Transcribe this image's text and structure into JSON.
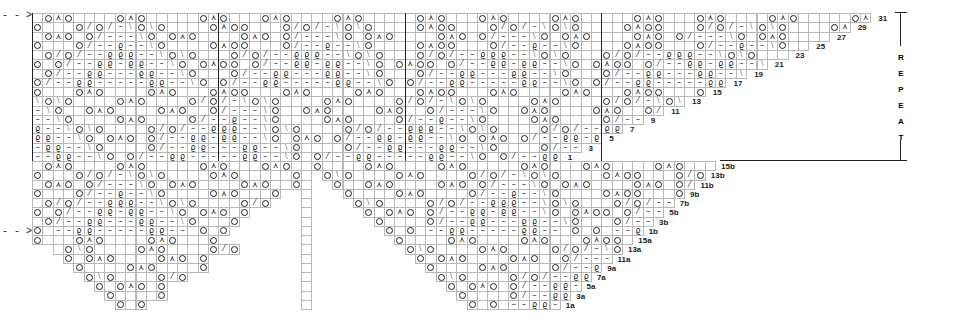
{
  "grid": {
    "origin_x": 32,
    "origin_y": 13,
    "cell_w": 10.35,
    "cell_h": 9.25,
    "line_color": "#b8b8b8",
    "ink_color": "#222222"
  },
  "legend_symbols": {
    "o": "yarn-over",
    "^": "double-decrease",
    "/": "k2tog",
    "\\": "ssk",
    "-": "purl",
    "8": "twisted-stitch",
    " ": "knit",
    ".": "no-stitch"
  },
  "upper_section": {
    "label": "repeat section",
    "rows": [
      {
        "row": 31,
        "cells": " o^o    o^o     o^o   o^o    o^o     o^o   o^o    o^o     o^o   o^o    o^o     o^o   o^o    o^o     o^o      o"
      },
      {
        "row": 30,
        "cells": "o   o/o/-\\o\\o    o^oo   o/o/-\\o\\o    o^oo   o/o/-\\o\\o    o^oo   o/o/-\\o\\o    o^oo   o/o/-\\o\\o   o^o  o/o"
      },
      {
        "row": 29,
        "cells": " o^o o/---\\o o^o    o^o o/---\\o o^o    o^o o/---\\o o^o    o^o o/---\\o o^o    o^o o/---\\o o^o  o^o o"
      },
      {
        "row": 28,
        "cells": "o   o/--8--\\o    o^oo   o/--8--\\o    o^oo   o/--8--\\o    o^oo   o/--8--\\o    o^oo   o/--8--\\o   o^o o"
      },
      {
        "row": 27,
        "cells": " o/o/--888--\\o\\o   o/o/--888--\\o\\o   o/o/--888--\\o\\o   o/o/--888--\\o\\o   o/o/--888--\\o\\o  o/o"
      },
      {
        "row": 26,
        "cells": "o o/--88-88--\\o o^oo o/--88-88--\\o o^oo o/--88-88--\\o o^oo o/--88-88--\\o o^oo o/--88-88--\\o o^o o"
      },
      {
        "row": 25,
        "cells": " o/--88---88--\\o   o/--88---88--\\o   o/--88---88--\\o   o/--88---88--\\o   o/--88---88--\\o   o"
      },
      {
        "row": 24,
        "cells": "o/--88-----88--\\o o/--88-----88--\\o o/--88-----88--\\o o/--88-----88--\\o o/--88-----88--  o o"
      },
      {
        "row": 23,
        "cells": "o   o^o    o^o   o^oo   o^o    o^o   o^oo   o^o    o^o   o^oo   o^o    o^o   o^oo   o^o    o^o   o o"
      },
      {
        "row": 22,
        "cells": "\\o\\o    o^o    o/o/-\\o\\o    o^o    o/o/-\\o\\o    o^o    o/o/-\\o\\o    o^o    o/o/-\\o\\o    o^o    o/o o"
      },
      {
        "row": 21,
        "cells": "-\\o  o^o    o^o  o/---\\o  o^o    o^o  o/---\\o  o^o    o^o  o/---\\o  o^o    o^o  o/---\\o  o^o    o^o  o"
      },
      {
        "row": 20,
        "cells": "--\\o    o^o    o/--8--\\o    o^o    o/--8--\\o    o^o    o/--8--\\o    o^o    o/--8--\\o    o^o    o"
      },
      {
        "row": 19,
        "cells": "8--\\o\\o    o/o/--888--\\o\\o    o/o/--888--\\o\\o    o/o/--888--\\o\\o    o/o/--888--\\o\\o    o/o"
      },
      {
        "row": 18,
        "cells": "88--\\o o^o o/--88-88--\\o o^o o/--88-88--\\o o^o o/--88-88--\\o o^o o/--88-88--\\o o^o o"
      },
      {
        "row": 17,
        "cells": "-88--\\o    o/--88---88--\\o    o/--88---88--\\o    o/--88---88--\\o    o/--88---88--\\o    o"
      },
      {
        "row": 16,
        "cells": "--88--\\o o/--88-----88--\\o o/--88-----88--\\o o/--88-----88--\\o o/--88-----88--\\o o/--88--  o o"
      }
    ],
    "row_labels": [
      "31",
      "29",
      "27",
      "25",
      "23",
      "21",
      "19",
      "17",
      "15",
      "13",
      "11",
      "9",
      "7",
      "5",
      "3",
      "1"
    ],
    "repeat_label": "REPEAT"
  },
  "lower_left": {
    "rows": [
      {
        "cells": " o^o    o^o     o^o   o^o    o^o     o^o      o  o"
      },
      {
        "cells": "o   o/o/-\\o\\o    o^o     o/o"
      },
      {
        "cells": " o^o o/---\\o o^o    o^o  o"
      },
      {
        "cells": "o   o/--8--\\o    o^o   o"
      },
      {
        "cells": " o/o/--888--\\o\\o    o/o"
      },
      {
        "cells": "o o/--88-88--\\o o^o o"
      },
      {
        "cells": " o/--88---88--\\o   o"
      },
      {
        "cells": "o --88-----88-- o o"
      },
      {
        "cells": "o   o^o    o^o   o"
      },
      {
        "cells": ".. o\\o    o^o    o/o"
      },
      {
        "cells": "...o o^o    o^o o"
      },
      {
        "cells": "....o    o^o    o"
      },
      {
        "cells": ".....o\\o    o/o"
      },
      {
        "cells": "......o o^o o"
      },
      {
        "cells": ".......o    o"
      },
      {
        "cells": "........o o"
      }
    ]
  },
  "lower_right": {
    "rows": [
      {
        "label": "15b",
        "cells": "o    o^o    o^o     o^o   o^o    o^o     o^o   o^o    o^o     o^o   o^o    o^o     o^o      o"
      },
      {
        "label": "13b",
        "cells": " o\\o    o^o    o/o/-\\o\\o    o^oo   o/o/-\\o\\o    o^oo   o/o/-\\o\\o    o^o    o/o"
      },
      {
        "label": "11b",
        "cells": "  o  o^o    o^o o/---\\o o^o    o^o o/---\\o o^o    o^o o/---\\o o^o    o^o  o"
      },
      {
        "label": "9b",
        "cells": "   o    o^o    o/--8--\\o    o^oo   o/--8--\\o    o^oo   o/--8--\\o    o^o    o"
      },
      {
        "label": "7b",
        "cells": "    o\\o    o/o/--888--\\o\\o   o/o/--888--\\o\\o   o/o/--888--\\o\\o    o/o"
      },
      {
        "label": "5b",
        "cells": "     o o^o o/--88-88--\\o o^oo o/--88-88--\\o o^oo o/--88-88--\\o o^o o"
      },
      {
        "label": "3b",
        "cells": "      o    o/--88---88--\\o   o/--88---88--\\o   o/--88---88--\\o    o"
      },
      {
        "label": "1b",
        "cells": "       o o --88-----88-- o o --88-----88-- o o --88-----88-- o o"
      },
      {
        "label": "15a",
        "cells": "        o    o^o    o^o   o^oo   o^o    o^o   o^oo   o^o    o^o    o"
      },
      {
        "label": "13a",
        "cells": "         o\\o    o^o    o/o/-\\o\\o    o^o    o/o/-\\o\\o    o^o    o/o"
      },
      {
        "label": "11a",
        "cells": "          o o^o    o^o  o/---\\o  o^o    o^o  o/---\\o  o^o    o^o o"
      },
      {
        "label": "9a",
        "cells": "           o    o^o    o/--8--\\o    o^o    o/--8--\\o    o^o    o"
      },
      {
        "label": "7a",
        "cells": "            o\\o    o/o/--888--\\o\\o    o/o/--888--\\o\\o    o/o"
      },
      {
        "label": "5a",
        "cells": "             o o^o o/--88-88--\\o o^o o/--88-88--\\o o^o o"
      },
      {
        "label": "3a",
        "cells": "              o    o/--88---88--\\o    o/--88---88--\\o    o"
      },
      {
        "label": "1a",
        "cells": "               o o --88-----88-- o o --88-----88-- o o"
      }
    ]
  },
  "markers": {
    "arrow_top": "- - >",
    "arrow_bottom": "- - >"
  }
}
